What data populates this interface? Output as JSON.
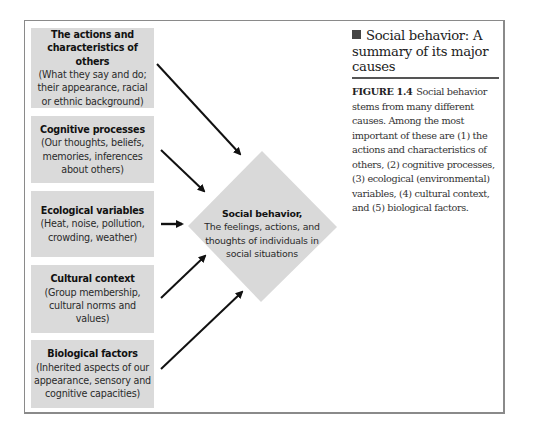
{
  "figure": {
    "title": "Social behavior: A summary of its major causes",
    "label": "FIGURE 1.4",
    "caption": "Social behavior stems from many different causes. Among the most important of these are (1) the actions and characteristics of others, (2) cognitive processes, (3) ecological (environmental) variables, (4) cultural context, and (5) biological factors.",
    "title_icon": "square-bullet-icon"
  },
  "causes": [
    {
      "title": "The actions and characteristics of others",
      "description": "(What they say and do; their appearance, racial or ethnic background)"
    },
    {
      "title": "Cognitive processes",
      "description": "(Our thoughts, beliefs, memories, inferences about others)"
    },
    {
      "title": "Ecological variables",
      "description": "(Heat, noise, pollution, crowding, weather)"
    },
    {
      "title": "Cultural context",
      "description": "(Group membership, cultural norms and values)"
    },
    {
      "title": "Biological factors",
      "description": "(Inherited aspects of our appearance, sensory and cognitive capacities)"
    }
  ],
  "outcome": {
    "title": "Social behavior,",
    "description": "The feelings, actions, and thoughts of individuals in social situations"
  },
  "colors": {
    "box_fill": "#dadada",
    "diamond_fill": "#d9d9d9",
    "arrow": "#111111",
    "frame": "#8a8a8a"
  }
}
